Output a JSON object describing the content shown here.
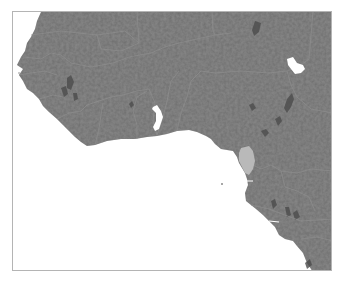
{
  "map": {
    "region": "West Africa",
    "style": "grayscale shaded relief",
    "colors": {
      "land": "#6e6e6e",
      "land_dark": "#4a4a4a",
      "water": "#ffffff",
      "borders": "#8e8e8e",
      "highlight": "#b9b9b9",
      "frame": "#b4b4b4"
    },
    "highlighted_feature": "Equatorial Guinea area near Gulf of Guinea coast",
    "lakes": [
      "Lake Volta",
      "Lake Chad"
    ]
  }
}
